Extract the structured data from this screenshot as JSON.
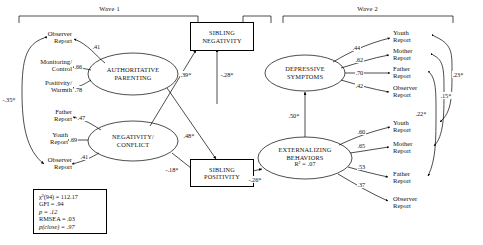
{
  "figure": {
    "type": "path-diagram"
  },
  "waves": [
    {
      "label": "Wave 1"
    },
    {
      "label": "Wave 2"
    }
  ],
  "latents": [
    {
      "id": "authoritative-parenting",
      "line1": "AUTHORITATIVE",
      "line2": "PARENTING"
    },
    {
      "id": "negativity-conflict",
      "line1": "NEGATIVITY/",
      "line2": "CONFLICT"
    },
    {
      "id": "depressive-symptoms",
      "line1": "DEPRESSIVE",
      "line2": "SYMPTOMS"
    },
    {
      "id": "externalizing-behaviors",
      "line1": "EXTERNALIZING",
      "line2": "BEHAVIORS",
      "r2": "R² = .07"
    }
  ],
  "observed_boxes": [
    {
      "id": "sibling-negativity",
      "line1": "SIBLING",
      "line2": "NEGATIVITY"
    },
    {
      "id": "sibling-positivity",
      "line1": "SIBLING",
      "line2": "POSITIVITY"
    }
  ],
  "indicators": {
    "authoritative_parenting": [
      {
        "line1": "Observer",
        "line2": "Report",
        "loading": ".41"
      },
      {
        "line1": "Monitoring/",
        "line2": "Control",
        "loading": ".66"
      },
      {
        "line1": "Positivity/",
        "line2": "Warmth",
        "loading": ".78"
      }
    ],
    "negativity_conflict": [
      {
        "line1": "Father",
        "line2": "Report",
        "loading": ".47"
      },
      {
        "line1": "Youth",
        "line2": "Report",
        "loading": ".69"
      },
      {
        "line1": "Observer",
        "line2": "Report",
        "loading": ".41"
      }
    ],
    "depressive_symptoms": [
      {
        "line1": "Youth",
        "line2": "Report",
        "loading": ".44"
      },
      {
        "line1": "Mother",
        "line2": "Report",
        "loading": ".62"
      },
      {
        "line1": "Father",
        "line2": "Report",
        "loading": ".70"
      },
      {
        "line1": "Observer",
        "line2": "Report",
        "loading": ".42"
      }
    ],
    "externalizing_behaviors": [
      {
        "line1": "Youth",
        "line2": "Report",
        "loading": ".60"
      },
      {
        "line1": "Mother",
        "line2": "Report",
        "loading": ".65"
      },
      {
        "line1": "Father",
        "line2": "Report",
        "loading": ".53"
      },
      {
        "line1": "Observer",
        "line2": "Report",
        "loading": ".37"
      }
    ]
  },
  "paths": {
    "parenting_to_sibneg": "-.28*",
    "negativity_to_sibneg": ".39*",
    "negativity_to_sibpos": "-.18*",
    "parenting_to_sibpos": ".48*",
    "sibpos_to_externalizing": "-.26*",
    "depressive_to_externalizing": ".50*",
    "parenting_negativity_corr": "-.35*"
  },
  "residual_correlations": [
    {
      "label": ".23*"
    },
    {
      "label": ".15*"
    },
    {
      "label": ".22*"
    }
  ],
  "fit_statistics": [
    {
      "id": "chi-square",
      "text": "χ²(94) = 112.17"
    },
    {
      "id": "gfi",
      "text": "GFI = .94"
    },
    {
      "id": "p-value",
      "text": "p = .12"
    },
    {
      "id": "rmsea",
      "text": "RMSEA = .03"
    },
    {
      "id": "pclose",
      "text": "p(close) = .97"
    }
  ]
}
